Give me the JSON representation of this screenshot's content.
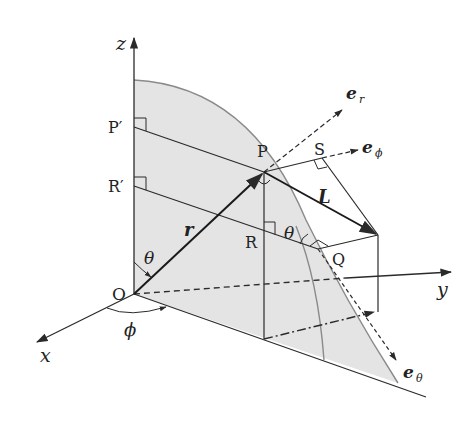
{
  "diagram": {
    "colors": {
      "stroke": "#2a2a2a",
      "shade": "#e4e4e4",
      "arc": "#8a8a8a",
      "background": "#ffffff"
    },
    "axes": {
      "x": "x",
      "y": "y",
      "z": "z"
    },
    "points": {
      "origin": "O",
      "P": "P",
      "P_prime": "P′",
      "R": "R",
      "R_prime": "R′",
      "S": "S",
      "Q": "Q"
    },
    "vectors": {
      "position": "r",
      "L": "L",
      "e_r": "e",
      "e_r_sub": "r",
      "e_phi": "e",
      "e_phi_sub": "ϕ",
      "e_theta": "e",
      "e_theta_sub": "θ"
    },
    "angles": {
      "theta_at_origin": "θ",
      "theta_at_R": "θ",
      "phi": "ϕ"
    }
  }
}
